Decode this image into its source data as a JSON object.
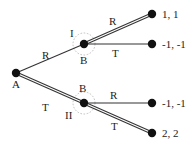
{
  "diagram": {
    "type": "extensive-form game tree",
    "colors": {
      "line": "#333333",
      "node": "#111111",
      "info_set": "#b8b8b8",
      "text": "#222222"
    },
    "nodes": [
      {
        "id": "root",
        "label": "A",
        "x": 16,
        "y": 73
      },
      {
        "id": "b_upper",
        "label": "B",
        "info_label": "I",
        "x": 84,
        "y": 44
      },
      {
        "id": "b_lower",
        "label": "B",
        "info_label": "II",
        "x": 84,
        "y": 103
      },
      {
        "id": "t1",
        "payoff": "1, 1",
        "x": 152,
        "y": 14
      },
      {
        "id": "t2",
        "payoff": "-1, -1",
        "x": 152,
        "y": 44
      },
      {
        "id": "t3",
        "payoff": "-1, -1",
        "x": 152,
        "y": 103
      },
      {
        "id": "t4",
        "payoff": "2, 2",
        "x": 152,
        "y": 133
      }
    ],
    "edges": [
      {
        "from": "root",
        "to": "b_upper",
        "label": "R",
        "highlighted": false
      },
      {
        "from": "root",
        "to": "b_lower",
        "label": "T",
        "highlighted": true
      },
      {
        "from": "b_upper",
        "to": "t1",
        "label": "R",
        "highlighted": true
      },
      {
        "from": "b_upper",
        "to": "t2",
        "label": "T",
        "highlighted": false
      },
      {
        "from": "b_lower",
        "to": "t3",
        "label": "R",
        "highlighted": false
      },
      {
        "from": "b_lower",
        "to": "t4",
        "label": "T",
        "highlighted": true
      }
    ],
    "labels": {
      "root": "A",
      "b_upper": "B",
      "b_upper_info": "I",
      "b_lower": "B",
      "b_lower_info": "II",
      "edge_root_upper": "R",
      "edge_root_lower": "T",
      "edge_upper_t1": "R",
      "edge_upper_t2": "T",
      "edge_lower_t3": "R",
      "edge_lower_t4": "T",
      "payoff_t1": "1, 1",
      "payoff_t2": "-1, -1",
      "payoff_t3": "-1, -1",
      "payoff_t4": "2, 2"
    }
  }
}
